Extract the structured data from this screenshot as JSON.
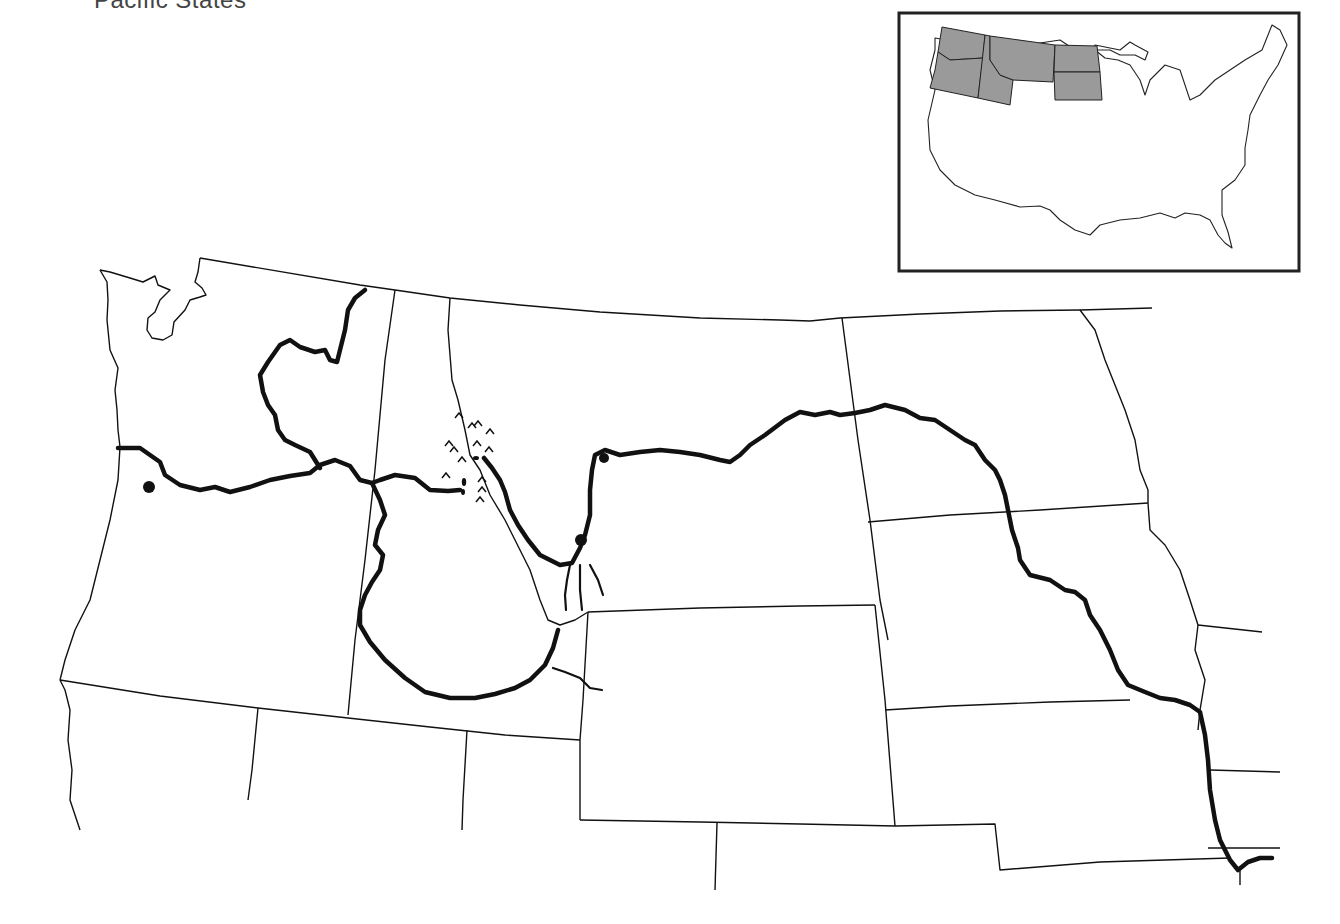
{
  "title": "Pacific States",
  "map": {
    "type": "regional-outline-map",
    "region": "Pacific Northwest and Northern Plains",
    "states_shown": [
      "Washington",
      "Oregon",
      "Idaho",
      "Montana",
      "Wyoming",
      "North Dakota",
      "South Dakota",
      "Nebraska",
      "Iowa",
      "Minnesota",
      "Nevada",
      "Utah",
      "Colorado",
      "Kansas",
      "Missouri",
      "California"
    ],
    "features": {
      "rivers": [
        "Columbia River",
        "Snake River",
        "Missouri River",
        "Clearwater River",
        "Bitterroot River",
        "Jefferson River",
        "Madison River",
        "Gallatin River",
        "Yellowstone tributary"
      ],
      "point_markers": 4,
      "mountain_symbols": "Bitterroot Range (caret marks)"
    }
  },
  "inset": {
    "label": "United States locator map",
    "highlighted_color": "#9a9a9a",
    "highlighted_states": [
      "Washington",
      "Oregon",
      "Idaho",
      "Montana",
      "North Dakota",
      "South Dakota"
    ]
  },
  "colors": {
    "background": "#ffffff",
    "line": "#111111",
    "highlight": "#9a9a9a"
  }
}
